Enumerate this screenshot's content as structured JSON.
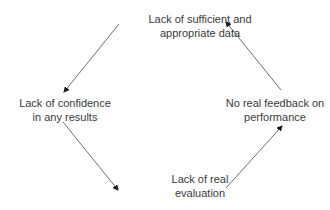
{
  "diagram": {
    "type": "cycle",
    "nodes": [
      {
        "id": "top",
        "lines": [
          "Lack of sufficient and",
          "appropriate data"
        ]
      },
      {
        "id": "left",
        "lines": [
          "Lack of confidence",
          "in any results"
        ]
      },
      {
        "id": "bottom",
        "lines": [
          "Lack of real",
          "evaluation"
        ]
      },
      {
        "id": "right",
        "lines": [
          "No real feedback on",
          "performance"
        ]
      }
    ],
    "edges": [
      {
        "from": "top",
        "to": "left"
      },
      {
        "from": "left",
        "to": "bottom"
      },
      {
        "from": "bottom",
        "to": "right"
      },
      {
        "from": "right",
        "to": "top"
      }
    ],
    "colors": {
      "text": "#3a3a3a",
      "arrow": "#6e6e6e",
      "arrowhead": "#1a1a1a",
      "background": "#ffffff"
    }
  }
}
